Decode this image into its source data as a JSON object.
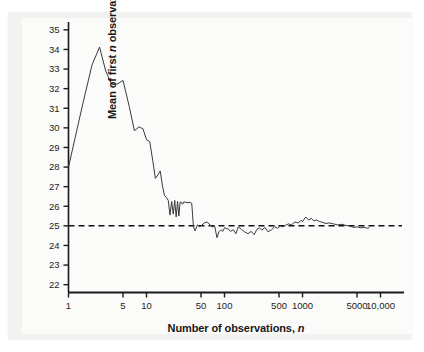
{
  "figure": {
    "name": "law-of-large-numbers-plot"
  },
  "axes": {
    "x": {
      "label_prefix": "Number of observations, ",
      "label_italic": "n",
      "scale": "log",
      "ticks": [
        1,
        5,
        10,
        50,
        100,
        500,
        1000,
        5000,
        10000
      ],
      "tick_labels": [
        "1",
        "5",
        "10",
        "50",
        "100",
        "500",
        "1000",
        "5000",
        "10,000"
      ],
      "range": [
        1,
        20000
      ]
    },
    "y": {
      "label_prefix": "Mean of first ",
      "label_italic": "n",
      "label_suffix": " observations",
      "ticks": [
        22,
        23,
        24,
        25,
        26,
        27,
        28,
        29,
        30,
        31,
        32,
        33,
        34,
        35
      ],
      "tick_labels": [
        "22",
        "23",
        "24",
        "25",
        "26",
        "27",
        "28",
        "29",
        "30",
        "31",
        "32",
        "33",
        "34",
        "35"
      ],
      "range": [
        21.6,
        35.4
      ]
    }
  },
  "reference_line": {
    "name": "population-mean-line",
    "value": 25,
    "style": "dashed",
    "color": "#111111"
  },
  "series_style": {
    "color": "#3a3a3a",
    "width": 1.0
  },
  "chart_data": {
    "type": "line",
    "title": "",
    "xlabel": "Number of observations, n",
    "ylabel": "Mean of first n observations",
    "xscale": "log",
    "xlim": [
      1,
      20000
    ],
    "ylim": [
      21.6,
      35.4
    ],
    "grid": false,
    "legend": "none",
    "annotations": [
      {
        "type": "hline",
        "y": 25,
        "label": "population mean = 25",
        "style": "dashed"
      }
    ],
    "series": [
      {
        "name": "Running mean of first n observations",
        "x": [
          1,
          1.5,
          2,
          2.5,
          3,
          3.6,
          4.3,
          5,
          6,
          7,
          8,
          9,
          10,
          11,
          12,
          13,
          14,
          15,
          16,
          17,
          18,
          19,
          20,
          21,
          22,
          23,
          24,
          25,
          26,
          27,
          28,
          29,
          30,
          32,
          34,
          36,
          38,
          40,
          42,
          45,
          48,
          50,
          55,
          60,
          65,
          70,
          75,
          80,
          85,
          90,
          95,
          100,
          110,
          120,
          130,
          140,
          150,
          165,
          180,
          200,
          220,
          240,
          260,
          280,
          300,
          330,
          360,
          400,
          440,
          480,
          520,
          560,
          600,
          660,
          720,
          800,
          880,
          960,
          1000,
          1100,
          1200,
          1300,
          1400,
          1500,
          1650,
          1800,
          2000,
          2200,
          2500,
          2800,
          3200,
          3600,
          4000,
          4500,
          5000,
          5600,
          6200,
          6800,
          7200
        ],
        "y": [
          28.0,
          31.1,
          33.2,
          34.12,
          32.9,
          32.2,
          32.25,
          32.42,
          31.1,
          29.85,
          30.05,
          29.95,
          29.4,
          29.3,
          28.35,
          27.42,
          27.6,
          27.8,
          27.05,
          26.55,
          26.45,
          26.3,
          25.55,
          26.25,
          25.6,
          26.3,
          25.45,
          26.25,
          25.5,
          26.22,
          26.2,
          26.1,
          26.22,
          26.2,
          26.18,
          26.2,
          26.15,
          24.95,
          24.75,
          25.05,
          24.95,
          25.0,
          25.15,
          25.2,
          25.05,
          24.95,
          24.98,
          24.4,
          24.7,
          24.8,
          24.72,
          24.9,
          24.85,
          24.72,
          24.8,
          24.6,
          24.95,
          24.82,
          24.7,
          24.6,
          24.72,
          24.55,
          24.82,
          24.9,
          24.78,
          24.92,
          24.7,
          24.8,
          24.95,
          24.88,
          25.0,
          24.95,
          25.02,
          25.1,
          25.05,
          25.2,
          25.15,
          25.28,
          25.22,
          25.45,
          25.3,
          25.38,
          25.25,
          25.3,
          25.22,
          25.18,
          25.12,
          25.15,
          25.1,
          25.05,
          25.08,
          25.02,
          25.0,
          24.92,
          24.95,
          24.9,
          24.92,
          24.88,
          24.9
        ]
      }
    ]
  }
}
